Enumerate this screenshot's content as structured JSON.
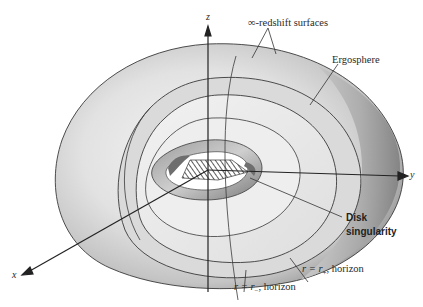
{
  "figure": {
    "axes": {
      "x": "x",
      "y": "y",
      "z": "z"
    },
    "labels": {
      "redshift": "∞-redshift surfaces",
      "ergosphere": "Ergosphere",
      "disk_line1": "Disk",
      "disk_line2": "singularity",
      "outer_horizon_r": "r = r",
      "outer_horizon_sub": "+",
      "outer_horizon_tail": ", horizon",
      "inner_horizon_r": "r = r",
      "inner_horizon_sub": "−",
      "inner_horizon_tail": ", horizon"
    },
    "colors": {
      "background": "#ffffff",
      "outline": "#3a3a3a",
      "surface_light": "#ebebeb",
      "surface_mid": "#cfcfcf",
      "surface_dark": "#8e8e8e"
    }
  }
}
